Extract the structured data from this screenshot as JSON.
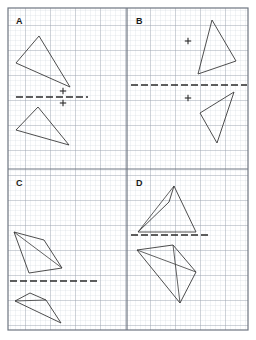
{
  "figure": {
    "type": "worksheet",
    "width": 256,
    "height": 340,
    "background_color": "#ffffff",
    "minor_grid_color": "#c9cfd8",
    "major_grid_color": "#9aa3ae",
    "border_color": "#6e7681",
    "shape_stroke_color": "#3a3a3a",
    "mirror_line_color": "#2b2b2b",
    "minor_grid_spacing": 5,
    "major_grid_spacing": 25
  },
  "layout": {
    "sheet_border": {
      "x": 8,
      "y": 8,
      "width": 240,
      "height": 322
    },
    "vertical_divider_x": 127,
    "horizontal_divider_y": 169
  },
  "panels": [
    {
      "id": "A",
      "label": "A",
      "label_pos": {
        "x": 16,
        "y": 24
      },
      "region": {
        "x": 8,
        "y": 8,
        "width": 119,
        "height": 161
      },
      "mirror_line": {
        "x1": 16,
        "y1": 97,
        "x2": 88,
        "y2": 97,
        "orientation": "horizontal"
      },
      "marks": [
        {
          "name": "plus-mark-upper",
          "x": 63,
          "y": 91
        },
        {
          "name": "plus-mark-lower",
          "x": 63,
          "y": 103
        }
      ],
      "shapes": [
        {
          "name": "pre-image-triangle",
          "kind": "triangle",
          "points": [
            [
              39,
              36
            ],
            [
              16,
              63
            ],
            [
              70,
              87
            ]
          ],
          "internal_segments": []
        },
        {
          "name": "image-triangle",
          "kind": "triangle",
          "points": [
            [
              38,
              107
            ],
            [
              16,
              130
            ],
            [
              69,
              145
            ]
          ],
          "internal_segments": []
        }
      ]
    },
    {
      "id": "B",
      "label": "B",
      "label_pos": {
        "x": 136,
        "y": 24
      },
      "region": {
        "x": 127,
        "y": 8,
        "width": 121,
        "height": 161
      },
      "mirror_line": {
        "x1": 131,
        "y1": 85,
        "x2": 247,
        "y2": 85,
        "orientation": "horizontal"
      },
      "marks": [
        {
          "name": "plus-mark-upper",
          "x": 188,
          "y": 41
        },
        {
          "name": "plus-mark-lower",
          "x": 188,
          "y": 98
        }
      ],
      "shapes": [
        {
          "name": "pre-image-triangle",
          "kind": "triangle",
          "points": [
            [
              212,
              20
            ],
            [
              236,
              61
            ],
            [
              198,
              74
            ]
          ],
          "internal_segments": []
        },
        {
          "name": "image-triangle",
          "kind": "triangle",
          "points": [
            [
              234,
              92
            ],
            [
              200,
              113
            ],
            [
              217,
              143
            ]
          ],
          "internal_segments": []
        }
      ]
    },
    {
      "id": "C",
      "label": "C",
      "label_pos": {
        "x": 16,
        "y": 186
      },
      "region": {
        "x": 8,
        "y": 169,
        "width": 119,
        "height": 161
      },
      "mirror_line": {
        "x1": 10,
        "y1": 281,
        "x2": 98,
        "y2": 281,
        "orientation": "horizontal"
      },
      "marks": [],
      "shapes": [
        {
          "name": "pre-image-quadrilateral",
          "kind": "quadrilateral",
          "points": [
            [
              14,
              232
            ],
            [
              44,
              240
            ],
            [
              62,
              268
            ],
            [
              29,
              273
            ]
          ],
          "internal_segments": [
            [
              [
                14,
                232
              ],
              [
                62,
                268
              ]
            ]
          ]
        },
        {
          "name": "image-quadrilateral",
          "kind": "quadrilateral",
          "points": [
            [
              15,
              301
            ],
            [
              30,
              293
            ],
            [
              46,
              300
            ],
            [
              61,
              323
            ]
          ],
          "internal_segments": [
            [
              [
                15,
                301
              ],
              [
                46,
                300
              ]
            ]
          ]
        }
      ]
    },
    {
      "id": "D",
      "label": "D",
      "label_pos": {
        "x": 136,
        "y": 186
      },
      "region": {
        "x": 127,
        "y": 169,
        "width": 121,
        "height": 161
      },
      "mirror_line": {
        "x1": 131,
        "y1": 235,
        "x2": 210,
        "y2": 235,
        "orientation": "horizontal"
      },
      "marks": [],
      "shapes": [
        {
          "name": "pre-image-quadrilateral",
          "kind": "quadrilateral",
          "points": [
            [
              174,
              186
            ],
            [
              196,
              232
            ],
            [
              138,
              232
            ],
            [
              169,
              202
            ]
          ],
          "internal_segments": [
            [
              [
                138,
                232
              ],
              [
                174,
                186
              ]
            ]
          ]
        },
        {
          "name": "image-quadrilateral",
          "kind": "quadrilateral",
          "points": [
            [
              137,
              250
            ],
            [
              173,
              245
            ],
            [
              196,
              272
            ],
            [
              180,
              303
            ]
          ],
          "internal_segments": [
            [
              [
                137,
                250
              ],
              [
                196,
                272
              ]
            ],
            [
              [
                173,
                245
              ],
              [
                180,
                303
              ]
            ]
          ]
        }
      ]
    }
  ]
}
